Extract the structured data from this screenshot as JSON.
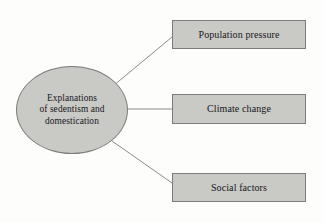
{
  "diagram": {
    "type": "concept-map",
    "background_color": "#fdfdfc",
    "shape_fill_color": "#c9c9c6",
    "shape_border_color": "#7c7c7a",
    "connector_color": "#8a8a88",
    "text_color": "#17171a",
    "root": {
      "id": "ellipse-node",
      "shape": "ellipse",
      "label": "Explanations\nof sedentism and\ndomestication"
    },
    "boxes": [
      {
        "id": "box-node-0",
        "shape": "rectangle",
        "label": "Population pressure"
      },
      {
        "id": "box-node-1",
        "shape": "rectangle",
        "label": "Climate change"
      },
      {
        "id": "box-node-2",
        "shape": "rectangle",
        "label": "Social factors"
      }
    ],
    "connectors": [
      {
        "from": "ellipse-node",
        "to": "box-node-0",
        "style": "straight-line"
      },
      {
        "from": "ellipse-node",
        "to": "box-node-1",
        "style": "straight-line"
      },
      {
        "from": "ellipse-node",
        "to": "box-node-2",
        "style": "straight-line"
      }
    ]
  }
}
